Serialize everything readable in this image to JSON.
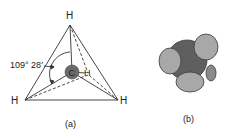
{
  "figure_a": {
    "atoms": {
      "top": "H",
      "left": "H",
      "right": "H",
      "back": "H",
      "center": "C"
    },
    "angle_label": "109° 28′",
    "caption": "(a)",
    "colors": {
      "lines": "#333333",
      "carbon": "#6b6b6b"
    }
  },
  "figure_b": {
    "caption": "(b)",
    "colors": {
      "carbon": "#5f5f5f",
      "hydrogen": "#a8a8a8",
      "outline": "#3a3a3a"
    }
  }
}
